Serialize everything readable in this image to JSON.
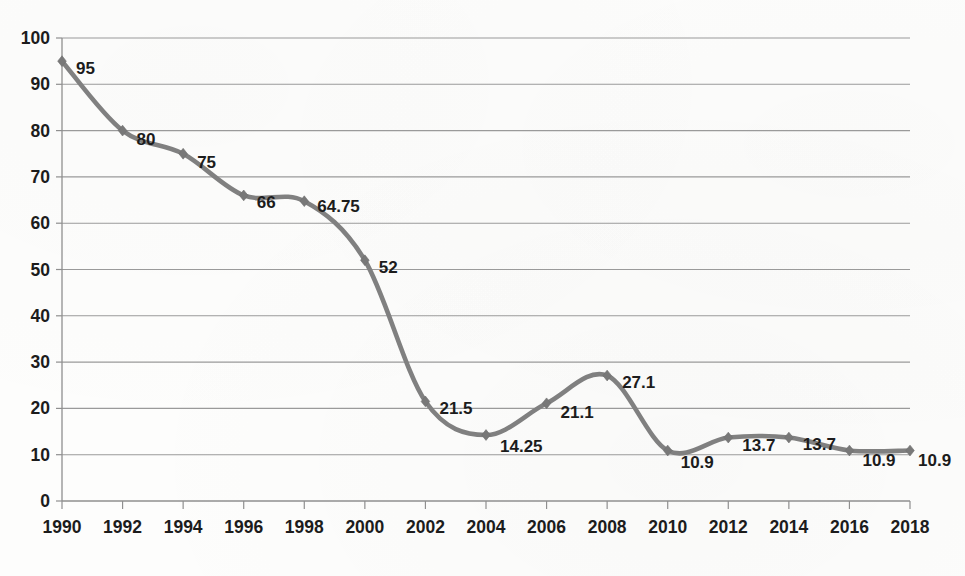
{
  "chart_data": {
    "type": "line",
    "title": "",
    "subtitle": "",
    "xlabel": "",
    "ylabel": "",
    "x": [
      1990,
      1992,
      1994,
      1996,
      1998,
      2000,
      2002,
      2004,
      2006,
      2008,
      2010,
      2012,
      2014,
      2016,
      2018
    ],
    "categories": [
      "1990",
      "1992",
      "1994",
      "1996",
      "1998",
      "2000",
      "2002",
      "2004",
      "2006",
      "2008",
      "2010",
      "2012",
      "2014",
      "2016",
      "2018"
    ],
    "values": [
      95,
      80,
      75,
      66,
      64.75,
      52,
      21.5,
      14.25,
      21.1,
      27.1,
      10.9,
      13.7,
      13.7,
      10.9,
      10.9
    ],
    "point_labels": [
      "95",
      "80",
      "75",
      "66",
      "64.75",
      "52",
      "21.5",
      "14.25",
      "21.1",
      "27.1",
      "10.9",
      "13.7",
      "13.7",
      "10.9",
      "10.9"
    ],
    "xlim": [
      1990,
      2018
    ],
    "ylim": [
      0,
      100
    ],
    "ytick_labels": [
      "0",
      "10",
      "20",
      "30",
      "40",
      "50",
      "60",
      "70",
      "80",
      "90",
      "100"
    ],
    "yticks": [
      0,
      10,
      20,
      30,
      40,
      50,
      60,
      70,
      80,
      90,
      100
    ],
    "grid": "horizontal",
    "legend": "none",
    "smoothing": "spline",
    "marker": "diamond",
    "colors": {
      "line": "#808080",
      "marker": "#787878",
      "gridline": "#9a9a9a",
      "axis": "#8f8f8f",
      "text": "#1c1c1c",
      "background": "#fdfdfc"
    }
  }
}
